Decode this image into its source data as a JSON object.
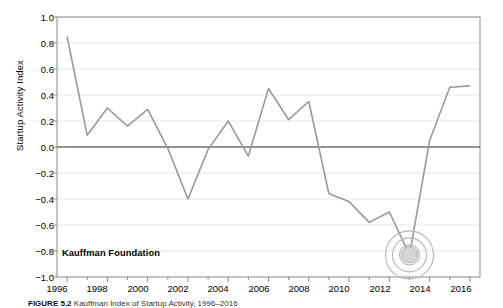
{
  "figure": {
    "caption_label": "FIGURE 5.2",
    "caption_text": "Kauffman Index of Startup Activity, 1996–2016"
  },
  "annotations": {
    "source_label": "Kauffman Foundation",
    "marker_name": "bullseye-marker",
    "marker_year": 2013,
    "marker_value": -0.83
  },
  "colors": {
    "line": "#9a9a9a",
    "zero_line": "#6e6e6e",
    "grid": "#e9e9e9",
    "axis": "#8a8a8a",
    "text": "#000000",
    "marker_fill": "#d6d6d6"
  },
  "chart_data": {
    "type": "line",
    "title": "",
    "xlabel": "",
    "ylabel": "Startup Activity Index",
    "xlim": [
      1995.5,
      2016.5
    ],
    "ylim": [
      -1.0,
      1.0
    ],
    "grid": true,
    "legend": "none",
    "x_tick_labels": [
      "1996",
      "1998",
      "2000",
      "2002",
      "2004",
      "2006",
      "2008",
      "2010",
      "2012",
      "2014",
      "2016"
    ],
    "x_tick_values": [
      1996,
      1998,
      2000,
      2002,
      2004,
      2006,
      2008,
      2010,
      2012,
      2014,
      2016
    ],
    "y_tick_labels": [
      "1.0",
      "0.8",
      "0.6",
      "0.4",
      "0.2",
      "0.0",
      "−0.2",
      "−0.4",
      "−0.6",
      "−0.8",
      "−1.0"
    ],
    "y_tick_values": [
      1.0,
      0.8,
      0.6,
      0.4,
      0.2,
      0.0,
      -0.2,
      -0.4,
      -0.6,
      -0.8,
      -1.0
    ],
    "series": [
      {
        "name": "Startup Activity Index",
        "x": [
          1996,
          1997,
          1998,
          1999,
          2000,
          2001,
          2002,
          2003,
          2004,
          2005,
          2006,
          2007,
          2008,
          2009,
          2010,
          2011,
          2012,
          2013,
          2014,
          2015,
          2016
        ],
        "values": [
          0.85,
          0.09,
          0.3,
          0.16,
          0.29,
          -0.01,
          -0.4,
          -0.02,
          0.2,
          -0.07,
          0.45,
          0.21,
          0.35,
          -0.36,
          -0.42,
          -0.58,
          -0.5,
          -0.83,
          0.05,
          0.46,
          0.47
        ]
      }
    ]
  }
}
